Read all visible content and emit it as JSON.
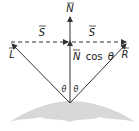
{
  "diagram": {
    "vectors": {
      "normal": {
        "label": "N",
        "bar": true
      },
      "light": {
        "label": "L",
        "bar": true
      },
      "reflect": {
        "label": "R",
        "bar": true
      },
      "s_left": {
        "label": "S",
        "bar": true
      },
      "s_right": {
        "label": "S",
        "bar": true
      },
      "projection": {
        "label": "N",
        "suffix": "cos",
        "angle": "θ"
      }
    },
    "angles": {
      "left": "θ",
      "right": "θ"
    },
    "colors": {
      "line": "#333333",
      "surface": "#d8d8d8",
      "background": "#ffffff"
    }
  }
}
